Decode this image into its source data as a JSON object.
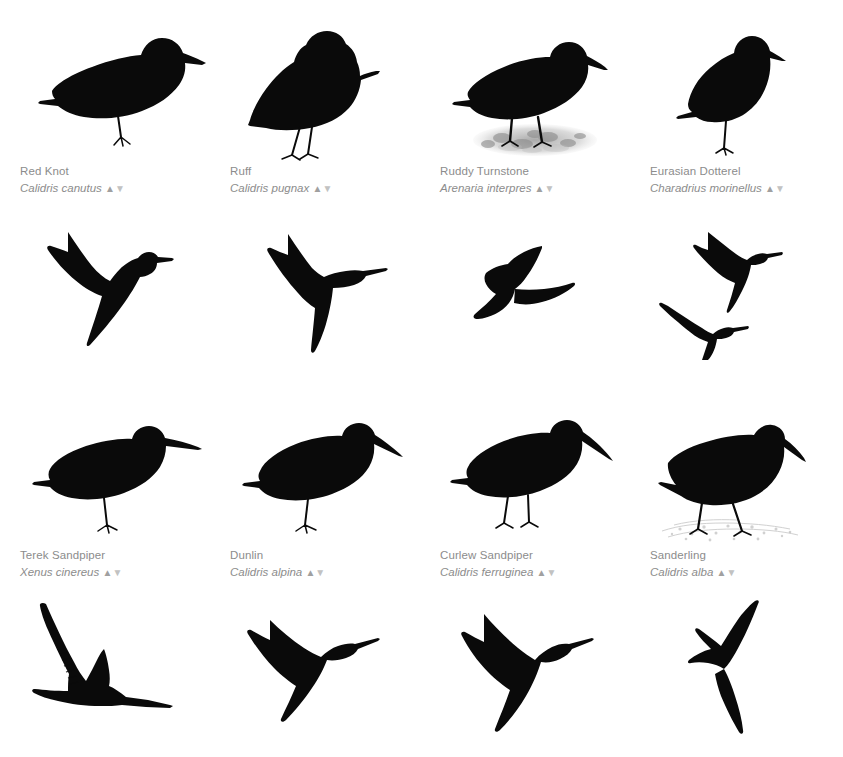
{
  "page": {
    "background_color": "#ffffff",
    "text_color": "#8c8c8c",
    "silhouette_color": "#0a0a0a",
    "columns": 4,
    "rows": 2
  },
  "glyphs": {
    "sort_up": "▲",
    "sort_down": "▼"
  },
  "species": [
    {
      "common_name": "Red Knot",
      "scientific_name": "Calidris canutus",
      "pose_standing": "plump-shorebird-standing-one-leg",
      "pose_flying": "single-bird-gliding-wings-swept",
      "ground_texture": "none"
    },
    {
      "common_name": "Ruff",
      "scientific_name": "Calidris pugnax",
      "pose_standing": "ruffed-neck-bird-standing-two-legs",
      "pose_flying": "single-bird-wings-outstretched",
      "ground_texture": "none"
    },
    {
      "common_name": "Ruddy Turnstone",
      "scientific_name": "Arenaria interpres",
      "pose_standing": "stocky-bird-standing-two-legs",
      "pose_flying": "single-bird-banking-left",
      "ground_texture": "pebbles"
    },
    {
      "common_name": "Eurasian Dotterel",
      "scientific_name": "Charadrius morinellus",
      "pose_standing": "upright-plover-standing-one-leg",
      "pose_flying": "two-birds-flying-formation",
      "ground_texture": "none"
    },
    {
      "common_name": "Terek Sandpiper",
      "scientific_name": "Xenus cinereus",
      "pose_standing": "long-upturned-bill-standing",
      "pose_flying": "single-bird-wings-raised-high",
      "ground_texture": "none"
    },
    {
      "common_name": "Dunlin",
      "scientific_name": "Calidris alpina",
      "pose_standing": "downcurved-bill-standing",
      "pose_flying": "single-bird-wings-angled-down",
      "ground_texture": "none"
    },
    {
      "common_name": "Curlew Sandpiper",
      "scientific_name": "Calidris ferruginea",
      "pose_standing": "slender-downcurved-bill-standing",
      "pose_flying": "single-bird-wings-swept-back",
      "ground_texture": "none"
    },
    {
      "common_name": "Sanderling",
      "scientific_name": "Calidris alba",
      "pose_standing": "crouched-foraging-bird",
      "pose_flying": "single-bird-wings-up-and-down",
      "ground_texture": "sand-speckle"
    }
  ]
}
